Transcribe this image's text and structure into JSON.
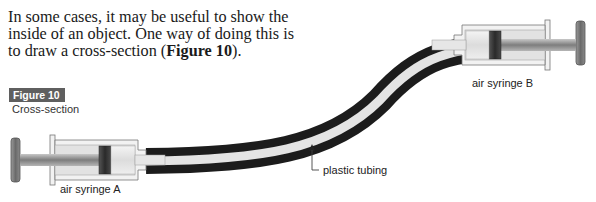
{
  "intro": {
    "text_before": "In some cases, it may be useful to show the inside of an object. One way of doing this is to draw a cross-section (",
    "bold_ref": "Figure 10",
    "text_after": ")."
  },
  "figure": {
    "badge": "Figure 10",
    "caption": "Cross-section"
  },
  "labels": {
    "syringe_a": "air syringe A",
    "syringe_b": "air syringe B",
    "tubing": "plastic tubing"
  },
  "colors": {
    "badge_bg": "#5f5f5f",
    "tube_wall": "#1e1e1e",
    "tube_inner": "#e6e6e6",
    "syringe_body": "#f2f2f2",
    "plunger_rod": "#9a9a9a",
    "piston": "#3a3a3a"
  }
}
